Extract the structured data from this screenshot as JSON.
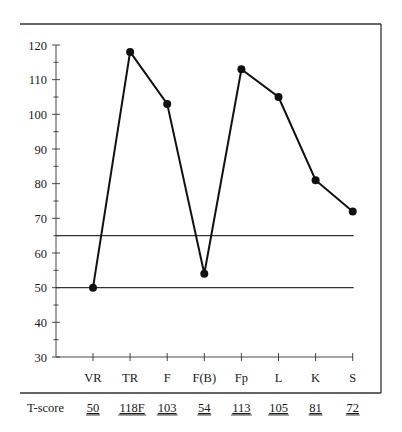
{
  "chart_data": {
    "type": "line",
    "title": "",
    "xlabel": "",
    "ylabel": "",
    "categories": [
      "VR",
      "TR",
      "F",
      "F(B)",
      "Fp",
      "L",
      "K",
      "S"
    ],
    "series": [
      {
        "name": "T-score",
        "values": [
          50,
          118,
          103,
          54,
          113,
          105,
          81,
          72
        ]
      }
    ],
    "ylim": [
      30,
      120
    ],
    "yticks": [
      30,
      40,
      50,
      60,
      70,
      80,
      90,
      100,
      110,
      120
    ],
    "yminor_step": 5,
    "reference_lines": [
      65,
      50
    ],
    "grid": false,
    "legend": "none",
    "score_row": {
      "label": "T-score",
      "values": [
        "50",
        "118F",
        "103",
        "54",
        "113",
        "105",
        "81",
        "72"
      ]
    }
  },
  "colors": {
    "line": "#111111",
    "axis": "#333333",
    "frame": "#333333",
    "background": "#ffffff"
  }
}
